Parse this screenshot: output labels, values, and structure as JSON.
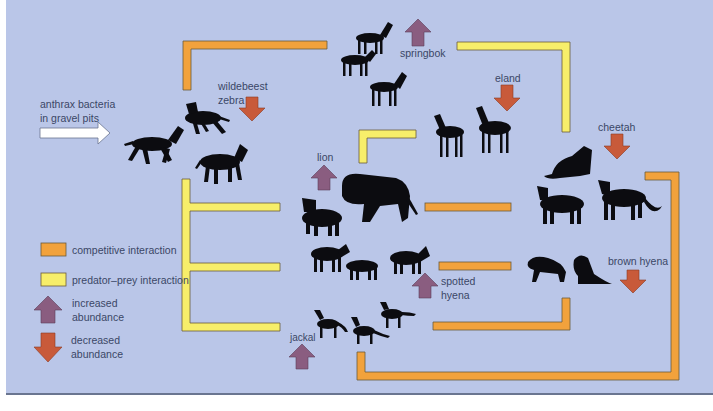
{
  "colors": {
    "background": "#bac6e8",
    "competitive": "#f2a23c",
    "predator_prey": "#f7ee6a",
    "bar_outline": "#6b5a3a",
    "increase_arrow": "#8a5d80",
    "decrease_arrow": "#c85a3a",
    "text": "#3b4766",
    "silhouette": "#0c0c10"
  },
  "input": {
    "label_line1": "anthrax bacteria",
    "label_line2": "in gravel pits",
    "icon": "white-right-arrow"
  },
  "species": [
    {
      "id": "wildebeest-zebra",
      "label_line1": "wildebeest",
      "label_line2": "zebra",
      "change": "decreased"
    },
    {
      "id": "springbok",
      "label": "springbok",
      "change": "increased"
    },
    {
      "id": "eland",
      "label": "eland",
      "change": "decreased"
    },
    {
      "id": "cheetah",
      "label": "cheetah",
      "change": "decreased"
    },
    {
      "id": "lion",
      "label": "lion",
      "change": "increased"
    },
    {
      "id": "spotted-hyena",
      "label_line1": "spotted",
      "label_line2": "hyena",
      "change": "increased"
    },
    {
      "id": "brown-hyena",
      "label": "brown hyena",
      "change": "decreased"
    },
    {
      "id": "jackal",
      "label": "jackal",
      "change": "increased"
    }
  ],
  "legend": {
    "competitive": "competitive  interaction",
    "predator_prey": "predator–prey  interaction",
    "increased_line1": "increased",
    "increased_line2": "abundance",
    "decreased_line1": "decreased",
    "decreased_line2": "abundance"
  }
}
